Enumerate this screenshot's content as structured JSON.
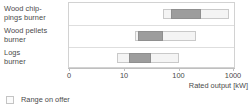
{
  "chart_data": {
    "type": "bar",
    "title": "",
    "subtitle": "",
    "xlabel": "Rated output [kW]",
    "ylabel": "",
    "orientation": "horizontal",
    "xscale": "log",
    "grid": false,
    "xlim": [
      3,
      1000
    ],
    "xticks": [
      0,
      10,
      100,
      1000
    ],
    "xticklabels": [
      "0",
      "10",
      "100",
      "1000"
    ],
    "legend": {
      "position": "below-left",
      "entries": [
        {
          "label": "Range on offer",
          "swatch_color": "#fbfbfb",
          "swatch_border": "#c4c4c4"
        }
      ]
    },
    "categories": [
      "Wood chippings burner",
      "Wood pellets burner",
      "Logs burner"
    ],
    "category_label_lines": [
      [
        "Wood chip-",
        "pings burner"
      ],
      [
        "Wood pellets",
        "burner"
      ],
      [
        "Logs",
        "burner"
      ]
    ],
    "series": [
      {
        "name": "Range on offer",
        "type": "span",
        "color": "#f4f4f4",
        "border": "#c9c9c9",
        "spans": [
          {
            "category": "Wood chippings burner",
            "start": 50,
            "end": 800
          },
          {
            "category": "Wood pellets burner",
            "start": 15,
            "end": 200
          },
          {
            "category": "Logs burner",
            "start": 7,
            "end": 100
          }
        ]
      },
      {
        "name": "Typical core range",
        "type": "span",
        "color": "#9d9d9d",
        "border": "#8f8f8f",
        "spans": [
          {
            "category": "Wood chippings burner",
            "start": 70,
            "end": 250
          },
          {
            "category": "Wood pellets burner",
            "start": 17,
            "end": 50
          },
          {
            "category": "Logs burner",
            "start": 12,
            "end": 30
          }
        ]
      }
    ],
    "units": "kW"
  },
  "axis": {
    "x_title": "Rated output [kW]",
    "ticks": [
      {
        "label": "0",
        "value": 0
      },
      {
        "label": "10",
        "value": 10
      },
      {
        "label": "100",
        "value": 100
      },
      {
        "label": "1000",
        "value": 1000
      }
    ]
  },
  "labels": {
    "cat0_line1": "Wood chip-",
    "cat0_line2": "pings burner",
    "cat1_line1": "Wood pellets",
    "cat1_line2": "burner",
    "cat2_line1": "Logs",
    "cat2_line2": "burner"
  },
  "legend": {
    "range_on_offer": "Range on offer"
  },
  "colors": {
    "outer_fill": "#f4f4f4",
    "outer_border": "#c9c9c9",
    "core_fill": "#9d9d9d",
    "core_border": "#8f8f8f",
    "frame": "#d2d2d2",
    "text": "#4a4a4a"
  }
}
